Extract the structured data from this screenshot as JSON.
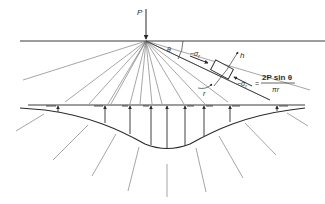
{
  "diagram": {
    "colors": {
      "line": "#3a3a3a",
      "radial": "#6a6a6a",
      "background": "#ffffff"
    },
    "labels": {
      "load": "P",
      "angle": "θ",
      "radial_stress": "−σ",
      "radial_stress_sub": "r",
      "h_axis": "h",
      "radius": "r",
      "formula_lhs": "−σ",
      "formula_lhs_sub": "r",
      "formula_eq": "=",
      "formula_numerator": "2P sin θ",
      "formula_denominator": "πr"
    }
  }
}
